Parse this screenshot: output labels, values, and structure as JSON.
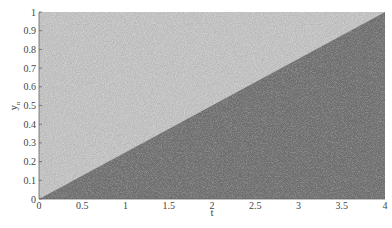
{
  "chart_data": {
    "type": "scatter",
    "title": "",
    "xlabel": "t",
    "ylabel": "y_n",
    "xlim": [
      0,
      4
    ],
    "ylim": [
      0,
      1
    ],
    "xticks": [
      0,
      0.5,
      1,
      1.5,
      2,
      2.5,
      3,
      3.5,
      4
    ],
    "xtick_labels": [
      "0",
      "0.5",
      "1",
      "1.5",
      "2",
      "2.5",
      "3",
      "3.5",
      "4"
    ],
    "yticks": [
      0,
      0.1,
      0.2,
      0.3,
      0.4,
      0.5,
      0.6,
      0.7,
      0.8,
      0.9,
      1
    ],
    "ytick_labels": [
      "0",
      "0.1",
      "0.2",
      "0.3",
      "0.4",
      "0.5",
      "0.6",
      "0.7",
      "0.8",
      "0.9",
      "1"
    ],
    "grid": false,
    "legend": null,
    "regions": [
      {
        "name": "above boundary (sparse)",
        "description": "light speckled gray points above line y = t/4",
        "color": "#a8a8a8"
      },
      {
        "name": "below boundary (dense)",
        "description": "dark gray dense points below line y = t/4",
        "color": "#6e6e6e"
      }
    ],
    "boundary_line": {
      "x": [
        0,
        4
      ],
      "y": [
        0,
        1
      ]
    },
    "annotation": "Dense random point cloud over [0,4]x[0,1]; density change along diagonal y = t/4"
  },
  "colors": {
    "light_region": "#a9a9a9",
    "dark_region": "#6f6f6f",
    "axis": "#555555"
  }
}
